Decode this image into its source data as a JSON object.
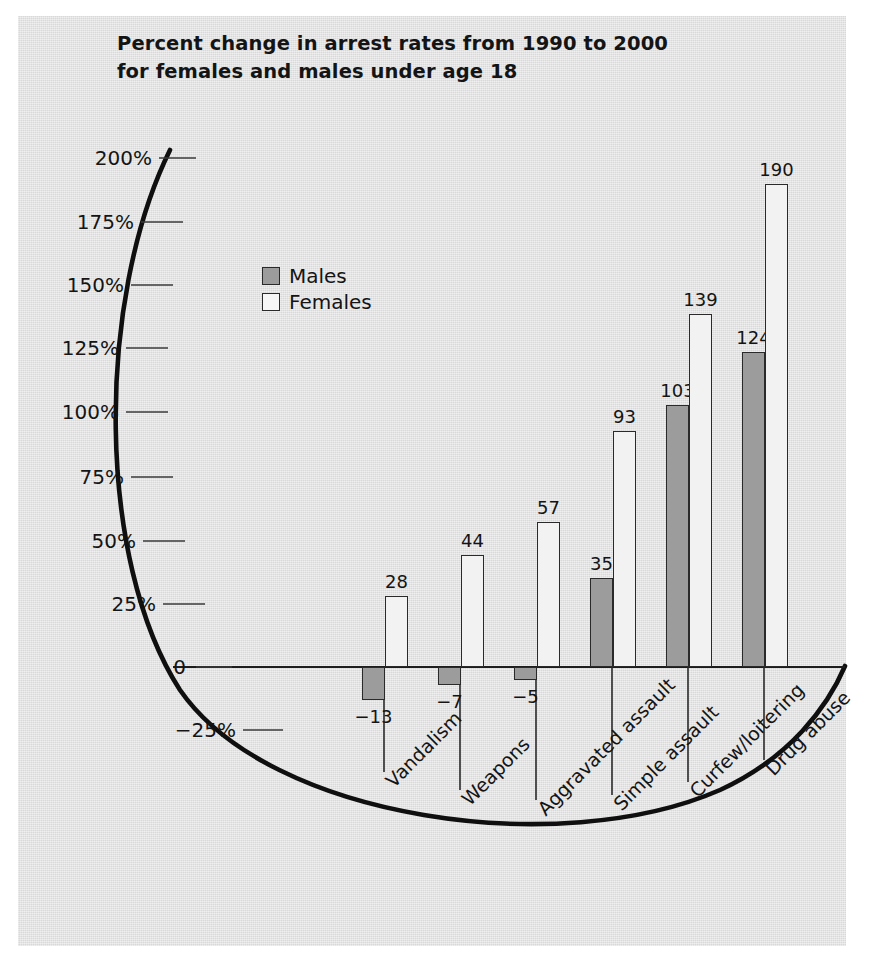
{
  "figure": {
    "background_color": "#dddddd",
    "paper_color": "#ffffff"
  },
  "title": {
    "line1": "Percent change in arrest rates from 1990 to 2000",
    "line2": "for females and males under age 18"
  },
  "legend": {
    "position": "upper-left-inside",
    "entries": [
      {
        "label": "Males",
        "color": "#9c9c9c"
      },
      {
        "label": "Females",
        "color": "#ffffff"
      }
    ]
  },
  "axis": {
    "y_tick_labels": [
      "200%",
      "175%",
      "150%",
      "125%",
      "100%",
      "75%",
      "50%",
      "25%",
      "0",
      "−25%"
    ],
    "y_tick_values": [
      200,
      175,
      150,
      125,
      100,
      75,
      50,
      25,
      0,
      -25
    ],
    "zero_label": "0"
  },
  "chart_data": {
    "type": "bar",
    "title": "Percent change in arrest rates from 1990 to 2000 for females and males under age 18",
    "xlabel": "",
    "ylabel": "",
    "ylim": [
      -25,
      200
    ],
    "grid": false,
    "legend_position": "upper left",
    "categories": [
      "Vandalism",
      "Weapons",
      "Aggravated assault",
      "Simple assault",
      "Curfew/loitering",
      "Drug abuse"
    ],
    "series": [
      {
        "name": "Males",
        "color": "#9c9c9c",
        "values": [
          -13,
          -7,
          -5,
          35,
          103,
          124
        ],
        "value_labels": [
          "−13",
          "−7",
          "−5",
          "35",
          "103",
          "124"
        ]
      },
      {
        "name": "Females",
        "color": "#ffffff",
        "values": [
          28,
          44,
          57,
          93,
          139,
          190
        ],
        "value_labels": [
          "28",
          "44",
          "57",
          "93",
          "139",
          "190"
        ]
      }
    ]
  }
}
